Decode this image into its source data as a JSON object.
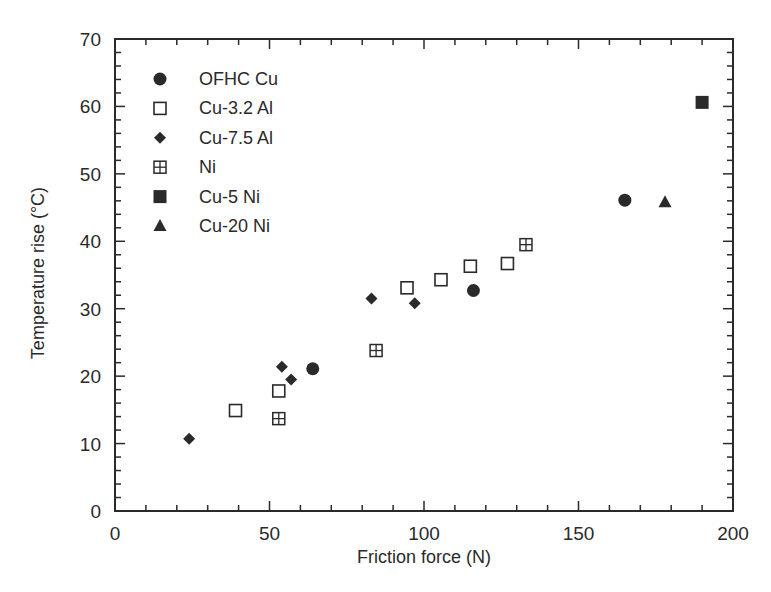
{
  "chart_data": {
    "type": "scatter",
    "title": "",
    "xlabel": "Friction force (N)",
    "ylabel": "Temperature rise (°C)",
    "xlim": [
      0,
      200
    ],
    "ylim": [
      0,
      70
    ],
    "xticks": [
      0,
      50,
      100,
      150,
      200
    ],
    "yticks": [
      0,
      10,
      20,
      30,
      40,
      50,
      60,
      70
    ],
    "x_minor_step": 10,
    "y_minor_step": 2,
    "grid": false,
    "legend_position": "upper left",
    "series": [
      {
        "name": "OFHC Cu",
        "marker": "filled-circle",
        "points": [
          [
            64,
            21.1
          ],
          [
            116,
            32.7
          ],
          [
            165,
            46.1
          ]
        ]
      },
      {
        "name": "Cu-3.2 Al",
        "marker": "open-square",
        "points": [
          [
            39,
            14.9
          ],
          [
            53,
            17.8
          ],
          [
            94.5,
            33.1
          ],
          [
            105.5,
            34.3
          ],
          [
            115,
            36.3
          ],
          [
            127,
            36.7
          ]
        ]
      },
      {
        "name": "Cu-7.5 Al",
        "marker": "filled-diamond",
        "points": [
          [
            24,
            10.7
          ],
          [
            54,
            21.4
          ],
          [
            57,
            19.5
          ],
          [
            83,
            31.5
          ],
          [
            97,
            30.8
          ]
        ]
      },
      {
        "name": "Ni",
        "marker": "crossed-square",
        "points": [
          [
            53,
            13.7
          ],
          [
            84.5,
            23.8
          ],
          [
            133,
            39.5
          ]
        ]
      },
      {
        "name": "Cu-5 Ni",
        "marker": "filled-square",
        "points": [
          [
            190,
            60.6
          ]
        ]
      },
      {
        "name": "Cu-20 Ni",
        "marker": "filled-triangle",
        "points": [
          [
            178,
            45.8
          ]
        ]
      }
    ]
  },
  "colors": {
    "ink": "#2a2a2a",
    "background": "#ffffff"
  }
}
